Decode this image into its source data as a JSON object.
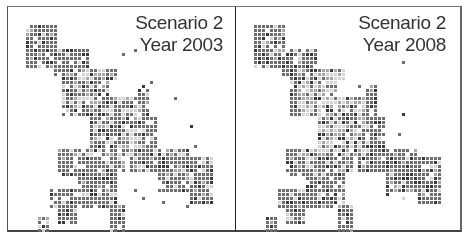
{
  "figure": {
    "panels": [
      {
        "id": "left",
        "scenario_label": "Scenario 2",
        "year_label": "Year 2003"
      },
      {
        "id": "right",
        "scenario_label": "Scenario 2",
        "year_label": "Year 2008"
      }
    ],
    "legend": "grayscale raster cells (dark = high, light = low)",
    "colors": {
      "dark": "#3a3a3a",
      "mid": "#6e6e6e",
      "light": "#a8a8a8",
      "pale": "#d4d4d4",
      "frame": "#444444"
    }
  }
}
